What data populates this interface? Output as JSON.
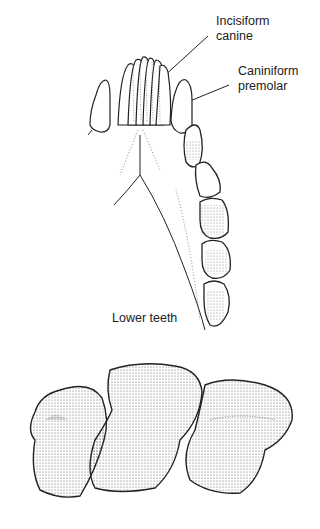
{
  "figure": {
    "labels": {
      "incisiform_canine_line1": "Incisiform",
      "incisiform_canine_line2": "canine",
      "caniniform_premolar_line1": "Caniniform",
      "caniniform_premolar_line2": "premolar",
      "lower_teeth": "Lower teeth"
    },
    "colors": {
      "stroke": "#222222",
      "stipple": "#555555",
      "background": "#ffffff"
    }
  }
}
